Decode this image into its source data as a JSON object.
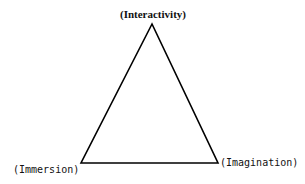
{
  "diagram": {
    "type": "triangle",
    "vertices": {
      "top": {
        "label": "(Interactivity)"
      },
      "bottom_left": {
        "label": "(Immersion)"
      },
      "bottom_right": {
        "label": "(Imagination)"
      }
    },
    "colors": {
      "stroke": "#000000",
      "background": "#ffffff"
    }
  }
}
